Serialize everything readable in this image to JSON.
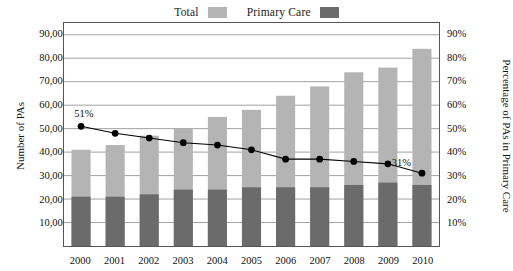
{
  "chart_data": {
    "type": "bar",
    "title": "",
    "subtitle": "",
    "categories": [
      "2000",
      "2001",
      "2002",
      "2003",
      "2004",
      "2005",
      "2006",
      "2007",
      "2008",
      "2009",
      "2010"
    ],
    "xlabel": "",
    "ylabel": "Number of PAs",
    "y2label": "Percentage of PAs in Primary Care",
    "ylim": [
      0,
      95000
    ],
    "y2lim": [
      0,
      95
    ],
    "yticks": [
      "10,000",
      "20,000",
      "30,000",
      "40,000",
      "50,000",
      "60,000",
      "70,000",
      "80,000",
      "90,000"
    ],
    "ytick_values": [
      10000,
      20000,
      30000,
      40000,
      50000,
      60000,
      70000,
      80000,
      90000
    ],
    "y2ticks": [
      "10%",
      "20%",
      "30%",
      "40%",
      "50%",
      "60%",
      "70%",
      "80%",
      "90%"
    ],
    "y2tick_values": [
      10,
      20,
      30,
      40,
      50,
      60,
      70,
      80,
      90
    ],
    "grid": true,
    "legend_position": "top-center",
    "stacked": true,
    "series": [
      {
        "name": "Total",
        "kind": "bar",
        "color": "#b4b4b4",
        "axis": "left",
        "values": [
          41000,
          43000,
          47000,
          50000,
          55000,
          58000,
          64000,
          68000,
          74000,
          76000,
          84000
        ]
      },
      {
        "name": "Primary Care",
        "kind": "bar",
        "color": "#6b6b6b",
        "axis": "left",
        "values": [
          21000,
          21000,
          22000,
          24000,
          24000,
          25000,
          25000,
          25000,
          26000,
          27000,
          26000
        ]
      },
      {
        "name": "Percentage of PAs in Primary Care",
        "kind": "line",
        "color": "#000000",
        "axis": "right",
        "values": [
          51,
          48,
          46,
          44,
          43,
          41,
          37,
          37,
          36,
          35,
          31
        ]
      }
    ],
    "annotations": [
      {
        "text": "51%",
        "category": "2000",
        "value": 51
      },
      {
        "text": "31%",
        "category": "2010",
        "value": 31
      }
    ]
  },
  "legend": {
    "entries": [
      {
        "label": "Total",
        "swatch": "total"
      },
      {
        "label": "Primary Care",
        "swatch": "primary"
      }
    ]
  },
  "colors": {
    "total_bar": "#b4b4b4",
    "primary_bar": "#6b6b6b",
    "line": "#000000",
    "grid": "#8a8a8a",
    "plot_border": "#555555"
  }
}
